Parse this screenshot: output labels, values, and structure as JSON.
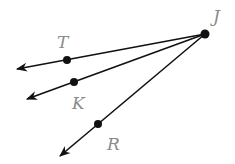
{
  "diagram": {
    "type": "rays",
    "vertex": {
      "label": "J",
      "x": 205,
      "y": 34,
      "label_x": 213,
      "label_y": 22
    },
    "rays": [
      {
        "name": "ray-JT",
        "point": {
          "label": "T",
          "x": 67,
          "y": 60,
          "label_x": 57,
          "label_y": 48
        },
        "tip": {
          "x": 17,
          "y": 69
        }
      },
      {
        "name": "ray-JK",
        "point": {
          "label": "K",
          "x": 74,
          "y": 82,
          "label_x": 72,
          "label_y": 109
        },
        "tip": {
          "x": 27,
          "y": 99
        }
      },
      {
        "name": "ray-JR",
        "point": {
          "label": "R",
          "x": 98,
          "y": 124,
          "label_x": 107,
          "label_y": 150
        },
        "tip": {
          "x": 60,
          "y": 156
        }
      }
    ],
    "colors": {
      "line": "#111111",
      "label": "#8a8a8a"
    }
  }
}
